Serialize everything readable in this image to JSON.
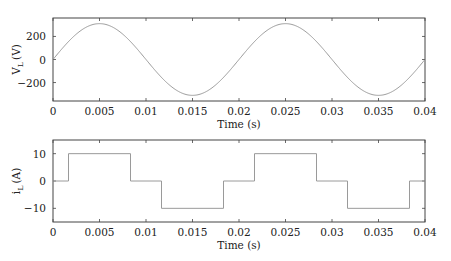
{
  "chart_data": [
    {
      "type": "line",
      "title": "",
      "xlabel": "Time (s)",
      "ylabel": "V_L (V)",
      "ylabel_main": "V",
      "ylabel_sub": "L",
      "ylabel_unit": "(V)",
      "xlim": [
        0,
        0.04
      ],
      "ylim": [
        -360,
        360
      ],
      "xticks": [
        0,
        0.005,
        0.01,
        0.015,
        0.02,
        0.025,
        0.03,
        0.035,
        0.04
      ],
      "xtick_labels": [
        "0",
        "0.005",
        "0.01",
        "0.015",
        "0.02",
        "0.025",
        "0.03",
        "0.035",
        "0.04"
      ],
      "yticks": [
        200,
        0,
        -200
      ],
      "ytick_labels": [
        "200",
        "0",
        "−200"
      ],
      "grid": false,
      "series": [
        {
          "name": "V_L",
          "description": "sinusoid, amplitude ~311 V, frequency 50 Hz",
          "amplitude": 311,
          "frequency_hz": 50,
          "color": "#9a9a9a"
        }
      ]
    },
    {
      "type": "line",
      "title": "",
      "xlabel": "Time (s)",
      "ylabel": "i_L (A)",
      "ylabel_main": "i",
      "ylabel_sub": "L",
      "ylabel_unit": "(A)",
      "xlim": [
        0,
        0.04
      ],
      "ylim": [
        -15,
        15
      ],
      "xticks": [
        0,
        0.005,
        0.01,
        0.015,
        0.02,
        0.025,
        0.03,
        0.035,
        0.04
      ],
      "xtick_labels": [
        "0",
        "0.005",
        "0.01",
        "0.015",
        "0.02",
        "0.025",
        "0.03",
        "0.035",
        "0.04"
      ],
      "yticks": [
        10,
        0,
        -10
      ],
      "ytick_labels": [
        "10",
        "0",
        "−10"
      ],
      "grid": false,
      "series": [
        {
          "name": "i_L",
          "description": "quasi-square wave (120° conduction), ±10 A",
          "x": [
            0,
            0.001667,
            0.001667,
            0.008333,
            0.008333,
            0.011667,
            0.011667,
            0.018333,
            0.018333,
            0.021667,
            0.021667,
            0.028333,
            0.028333,
            0.031667,
            0.031667,
            0.038333,
            0.038333,
            0.04
          ],
          "y": [
            0,
            0,
            10,
            10,
            0,
            0,
            -10,
            -10,
            0,
            0,
            10,
            10,
            0,
            0,
            -10,
            -10,
            0,
            0
          ],
          "color": "#9a9a9a"
        }
      ]
    }
  ]
}
